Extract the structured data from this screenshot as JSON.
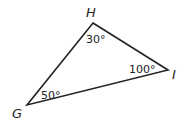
{
  "diagram": {
    "type": "triangle",
    "stroke_color": "#222222",
    "vertices": [
      {
        "id": "H",
        "label": "H",
        "x": 93,
        "y": 23,
        "angle": "30°"
      },
      {
        "id": "I",
        "label": "I",
        "x": 168,
        "y": 70,
        "angle": "100°"
      },
      {
        "id": "G",
        "label": "G",
        "x": 27,
        "y": 105,
        "angle": "50°"
      }
    ]
  }
}
